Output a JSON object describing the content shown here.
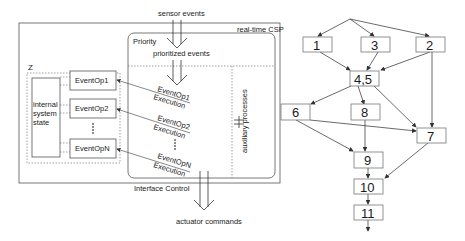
{
  "left_diagram": {
    "input_label": "sensor events",
    "output_label": "actuator commands",
    "outer_box_label": "real-time CSP",
    "priority_label": "Priority",
    "prioritized_label": "prioritized events",
    "interface_label": "Interface Control",
    "aux_label": "auxiliary processes",
    "z_label": "Z",
    "state_label_lines": [
      "internal",
      "system",
      "state"
    ],
    "event_ops": [
      "EventOp1",
      "EventOp2",
      "EventOpN"
    ],
    "exec_labels": [
      {
        "op": "EventOp1",
        "exec": "Execution"
      },
      {
        "op": "EventOp2",
        "exec": "Execution"
      },
      {
        "op": "EventOpN",
        "exec": "Execution"
      }
    ],
    "ellipsis": "⋮"
  },
  "right_diagram": {
    "nodes": {
      "n1": "1",
      "n3": "3",
      "n2": "2",
      "n45": "4,5",
      "n6": "6",
      "n8": "8",
      "n7": "7",
      "n9": "9",
      "n10": "10",
      "n11": "11"
    },
    "edges": [
      [
        "root",
        "1"
      ],
      [
        "root",
        "3"
      ],
      [
        "root",
        "2"
      ],
      [
        "1",
        "4,5"
      ],
      [
        "3",
        "4,5"
      ],
      [
        "2",
        "4,5"
      ],
      [
        "2",
        "7"
      ],
      [
        "4,5",
        "6"
      ],
      [
        "4,5",
        "8"
      ],
      [
        "4,5",
        "7"
      ],
      [
        "6",
        "7"
      ],
      [
        "6",
        "9"
      ],
      [
        "8",
        "9"
      ],
      [
        "7",
        "10"
      ],
      [
        "9",
        "10"
      ],
      [
        "10",
        "11"
      ],
      [
        "11",
        "out"
      ]
    ]
  }
}
